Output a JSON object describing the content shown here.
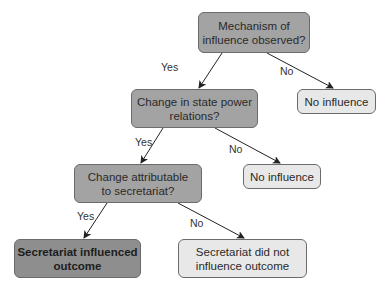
{
  "diagram": {
    "type": "decision-tree",
    "nodes": {
      "q1": {
        "text": "Mechanism of\ninfluence observed?",
        "kind": "decision"
      },
      "no1": {
        "text": "No influence",
        "kind": "outcome"
      },
      "q2": {
        "text": "Change in state power\nrelations?",
        "kind": "decision"
      },
      "no2": {
        "text": "No influence",
        "kind": "outcome"
      },
      "q3": {
        "text": "Change attributable\nto secretariat?",
        "kind": "decision"
      },
      "yes_final": {
        "text": "Secretariat influenced\noutcome",
        "kind": "outcome"
      },
      "no3": {
        "text": "Secretariat did not\ninfluence outcome",
        "kind": "outcome"
      }
    },
    "edges": [
      {
        "from": "q1",
        "to": "q2",
        "label": "Yes"
      },
      {
        "from": "q1",
        "to": "no1",
        "label": "No"
      },
      {
        "from": "q2",
        "to": "q3",
        "label": "Yes"
      },
      {
        "from": "q2",
        "to": "no2",
        "label": "No"
      },
      {
        "from": "q3",
        "to": "yes_final",
        "label": "Yes"
      },
      {
        "from": "q3",
        "to": "no3",
        "label": "No"
      }
    ],
    "colors": {
      "decision_fill": "#a3a3a3",
      "final_positive_fill": "#8e8e8e",
      "outcome_fill": "#e8e8e8",
      "border": "#6b6b6b",
      "arrow": "#222222"
    }
  }
}
